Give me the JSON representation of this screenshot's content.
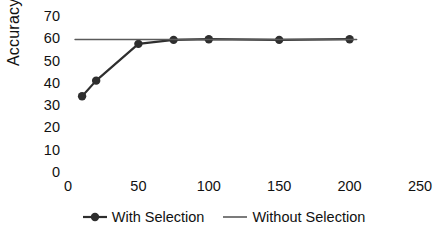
{
  "chart_data": {
    "type": "line",
    "title": "",
    "xlabel": "",
    "ylabel": "Accuracy",
    "xlim": [
      0,
      250
    ],
    "ylim": [
      0,
      70
    ],
    "grid": false,
    "legend_position": "bottom",
    "x_ticks": [
      "0",
      "50",
      "100",
      "150",
      "200",
      "250"
    ],
    "x_tick_values": [
      0,
      50,
      100,
      150,
      200,
      250
    ],
    "y_ticks": [
      "0",
      "10",
      "20",
      "30",
      "40",
      "50",
      "60",
      "70"
    ],
    "y_tick_values": [
      0,
      10,
      20,
      30,
      40,
      50,
      60,
      70
    ],
    "series": [
      {
        "name": "With Selection",
        "marker": "circle",
        "color": "#2e2e2e",
        "x": [
          10,
          20,
          50,
          75,
          100,
          150,
          200
        ],
        "values": [
          34,
          41,
          57.5,
          59.3,
          59.6,
          59.3,
          59.6
        ]
      },
      {
        "name": "Without Selection",
        "marker": "none",
        "color": "#5a5a5a",
        "x": [
          5,
          205
        ],
        "values": [
          59.5,
          59.5
        ]
      }
    ]
  },
  "legend": {
    "entries": [
      {
        "label": "With Selection",
        "style": "line-marker",
        "color": "#2e2e2e"
      },
      {
        "label": "Without Selection",
        "style": "line",
        "color": "#5a5a5a"
      }
    ]
  },
  "colors": {
    "with_selection": "#2e2e2e",
    "without_selection": "#5a5a5a",
    "text": "#111111",
    "background": "#ffffff"
  }
}
